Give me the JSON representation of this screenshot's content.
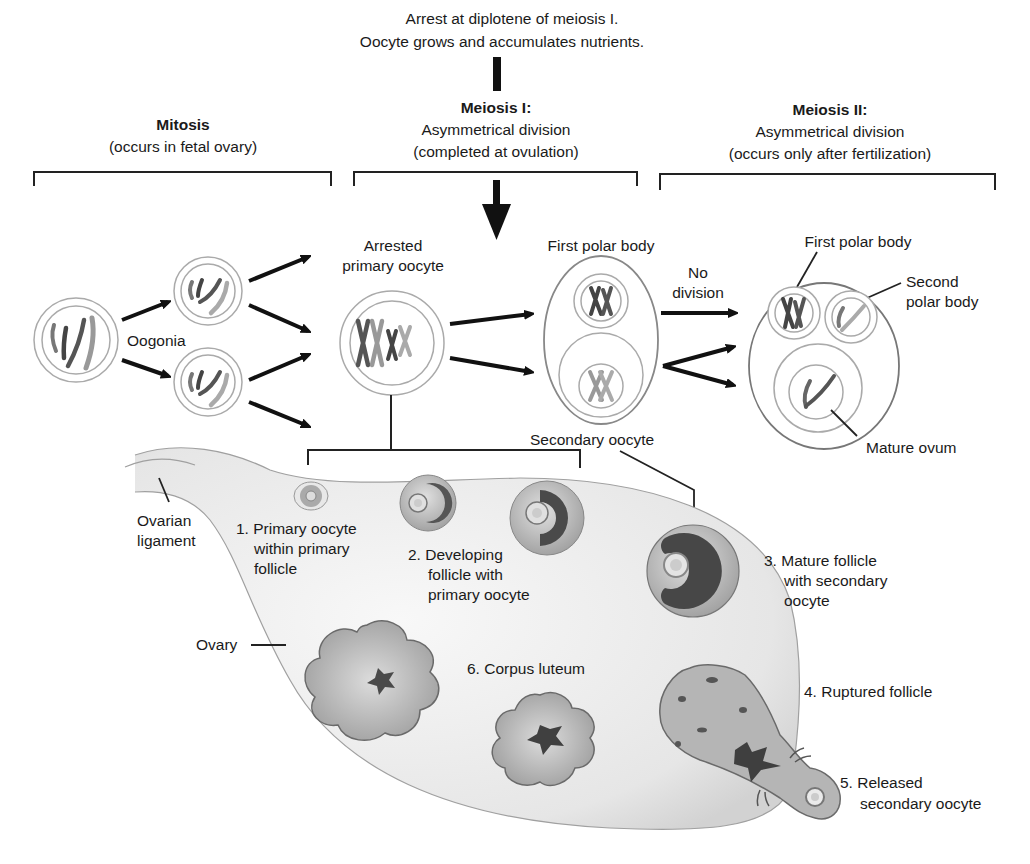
{
  "top_note": {
    "line1": "Arrest at diplotene of meiosis I.",
    "line2": "Oocyte grows and accumulates nutrients."
  },
  "phases": {
    "mitosis": {
      "title": "Mitosis",
      "subtitle": "(occurs in fetal ovary)"
    },
    "meiosis1": {
      "title": "Meiosis I:",
      "line1": "Asymmetrical division",
      "line2": "(completed at ovulation)"
    },
    "meiosis2": {
      "title": "Meiosis II:",
      "line1": "Asymmetrical division",
      "line2": "(occurs only after fertilization)"
    }
  },
  "cells": {
    "oogonia": "Oogonia",
    "arrested_line1": "Arrested",
    "arrested_line2": "primary oocyte",
    "first_polar_body_mid": "First polar body",
    "secondary_oocyte": "Secondary oocyte",
    "no_division_line1": "No",
    "no_division_line2": "division",
    "first_polar_body_right": "First polar body",
    "second_polar_body_line1": "Second",
    "second_polar_body_line2": "polar body",
    "mature_ovum": "Mature ovum"
  },
  "ovary": {
    "ligament_line1": "Ovarian",
    "ligament_line2": "ligament",
    "ovary_label": "Ovary",
    "stage1": [
      "1. Primary oocyte",
      "within primary",
      "follicle"
    ],
    "stage2": [
      "2. Developing",
      "follicle with",
      "primary oocyte"
    ],
    "stage3": [
      "3. Mature follicle",
      "with secondary",
      "oocyte"
    ],
    "stage4": "4. Ruptured follicle",
    "stage5": [
      "5. Released",
      "secondary oocyte"
    ],
    "stage6": "6. Corpus luteum"
  },
  "colors": {
    "ovary_fill": "#ebebeb",
    "ovary_edge": "#9a9a9a",
    "follicle_fill": "#b8b8b8",
    "antrum_fill": "#4a4a4a",
    "chromosome_dark": "#4d4d4d",
    "chromosome_light": "#9a9a9a",
    "cell_outline": "#999999"
  }
}
